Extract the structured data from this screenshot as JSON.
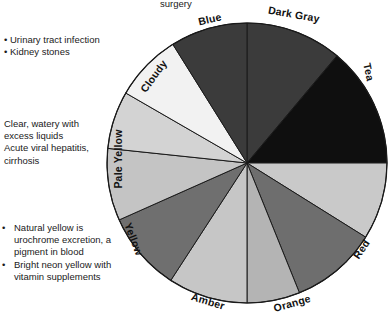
{
  "figure": {
    "type": "pie-wheel",
    "center": {
      "x": 247,
      "y": 163
    },
    "radius": 140
  },
  "top_note": "surgery",
  "notes": {
    "top": {
      "items": [
        "Urinary tract infection",
        "Kidney stones"
      ]
    },
    "middle": {
      "items": [
        "Clear, watery with excess liquids",
        "Acute viral hepatitis, cirrhosis"
      ]
    },
    "bottom": {
      "items": [
        "Natural yellow is urochrome excretion, a pigment in blood",
        "Bright neon yellow with vitamin supplements"
      ]
    }
  },
  "chart_data": {
    "type": "pie",
    "xlabel": "",
    "ylabel": "",
    "legend_position": "around-perimeter",
    "grid": false,
    "labels": [
      "Dark Gray",
      "Tea",
      "Red",
      "Orange",
      "Amber",
      "Yellow",
      "Pale Yellow",
      "Cloudy",
      "Blue"
    ],
    "slice_count": 11,
    "slices": [
      {
        "label": "Dark Gray",
        "start_deg": 0,
        "end_deg": 40,
        "value": 40,
        "color": "#3b3b3b",
        "label_angle_deg": 20
      },
      {
        "label": "Tea",
        "start_deg": 40,
        "end_deg": 90,
        "value": 50,
        "color": "#0f0f0f",
        "label_angle_deg": 66
      },
      {
        "label": "",
        "start_deg": 90,
        "end_deg": 122,
        "value": 32,
        "color": "#c9c9c9",
        "label_angle_deg": 106
      },
      {
        "label": "Red",
        "start_deg": 122,
        "end_deg": 158,
        "value": 36,
        "color": "#6e6e6e",
        "label_angle_deg": 141
      },
      {
        "label": "",
        "start_deg": 158,
        "end_deg": 180,
        "value": 22,
        "color": "#b4b4b4",
        "label_angle_deg": 169
      },
      {
        "label": "Orange",
        "start_deg": 180,
        "end_deg": 213,
        "value": 33,
        "color": "#c6c6c6",
        "label_angle_deg": 196
      },
      {
        "label": "Amber",
        "start_deg": 213,
        "end_deg": 246,
        "value": 33,
        "color": "#6f6f6f",
        "label_angle_deg": 230
      },
      {
        "label": "Yellow",
        "start_deg": 246,
        "end_deg": 276,
        "value": 30,
        "color": "#c4c4c4",
        "label_angle_deg": 261
      },
      {
        "label": "Pale Yellow",
        "start_deg": 276,
        "end_deg": 300,
        "value": 24,
        "color": "#d3d3d3",
        "label_angle_deg": 288
      },
      {
        "label": "Cloudy",
        "start_deg": 300,
        "end_deg": 328,
        "value": 28,
        "color": "#f2f2f2",
        "label_angle_deg": 314
      },
      {
        "label": "Blue",
        "start_deg": 328,
        "end_deg": 360,
        "value": 32,
        "color": "#3b3b3b",
        "label_angle_deg": 344
      }
    ],
    "colors": {
      "dark_gray": "#3b3b3b",
      "tea": "#0f0f0f",
      "light_gray": "#c9c9c9",
      "red": "#6e6e6e",
      "pale_gray": "#b4b4b4",
      "orange": "#c6c6c6",
      "amber": "#6f6f6f",
      "yellow": "#c4c4c4",
      "pale_yellow": "#d3d3d3",
      "cloudy": "#f2f2f2",
      "blue": "#3b3b3b",
      "outline": "#1a1a1a",
      "background": "#ffffff"
    }
  },
  "wedge_labels": [
    {
      "text": "Dark Gray",
      "x": 268,
      "y": 8,
      "rotate": 10
    },
    {
      "text": "Tea",
      "x": 360,
      "y": 66,
      "rotate": 78
    },
    {
      "text": "Red",
      "x": 351,
      "y": 243,
      "rotate": -56
    },
    {
      "text": "Orange",
      "x": 273,
      "y": 297,
      "rotate": -16
    },
    {
      "text": "Amber",
      "x": 191,
      "y": 295,
      "rotate": 17
    },
    {
      "text": "Yellow",
      "x": 117,
      "y": 233,
      "rotate": 69
    },
    {
      "text": "Pale Yellow",
      "x": 88,
      "y": 153,
      "rotate": -90
    },
    {
      "text": "Cloudy",
      "x": 135,
      "y": 70,
      "rotate": -54
    },
    {
      "text": "Blue",
      "x": 198,
      "y": 13,
      "rotate": -13
    }
  ]
}
